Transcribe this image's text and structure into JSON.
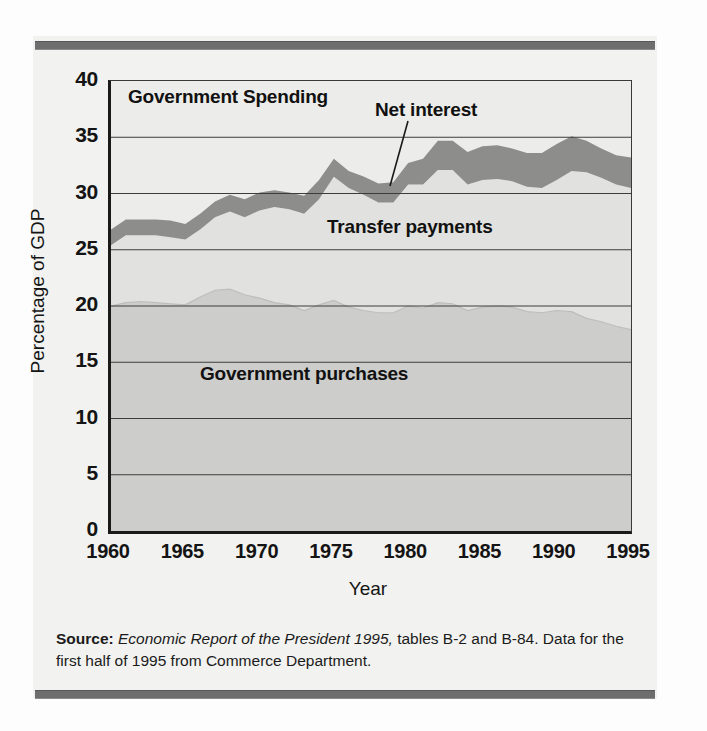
{
  "chart_data": {
    "type": "area",
    "title": "Government Spending",
    "xlabel": "Year",
    "ylabel": "Percentage of GDP",
    "xlim": [
      1960,
      1995
    ],
    "ylim": [
      0,
      40
    ],
    "ytick_labels": [
      "40",
      "35",
      "30",
      "25",
      "20",
      "15",
      "10",
      "5",
      "0"
    ],
    "ytick_values": [
      40,
      35,
      30,
      25,
      20,
      15,
      10,
      5,
      0
    ],
    "xtick_labels": [
      "1960",
      "1965",
      "1970",
      "1975",
      "1980",
      "1985",
      "1990",
      "1995"
    ],
    "xtick_values": [
      1960,
      1965,
      1970,
      1975,
      1980,
      1985,
      1990,
      1995
    ],
    "grid": true,
    "legend_position": "inline-annotations",
    "stacked": true,
    "x": [
      1960,
      1961,
      1962,
      1963,
      1964,
      1965,
      1966,
      1967,
      1968,
      1969,
      1970,
      1971,
      1972,
      1973,
      1974,
      1975,
      1976,
      1977,
      1978,
      1979,
      1980,
      1981,
      1982,
      1983,
      1984,
      1985,
      1986,
      1987,
      1988,
      1989,
      1990,
      1991,
      1992,
      1993,
      1994,
      1995
    ],
    "series": [
      {
        "name": "Government purchases",
        "color": "#cdcdcb",
        "values": [
          20.0,
          20.3,
          20.4,
          20.3,
          20.2,
          20.1,
          20.8,
          21.4,
          21.5,
          21.0,
          20.7,
          20.3,
          20.1,
          19.6,
          20.1,
          20.5,
          19.9,
          19.6,
          19.4,
          19.4,
          20.0,
          19.8,
          20.3,
          20.2,
          19.6,
          19.9,
          20.0,
          19.9,
          19.5,
          19.4,
          19.6,
          19.5,
          18.9,
          18.6,
          18.2,
          17.9
        ]
      },
      {
        "name": "Transfer payments",
        "color": "#e1e1df",
        "values": [
          5.4,
          6.0,
          5.9,
          6.0,
          5.9,
          5.8,
          6.0,
          6.5,
          6.9,
          6.9,
          7.8,
          8.5,
          8.5,
          8.6,
          9.4,
          11.0,
          10.6,
          10.3,
          9.8,
          9.8,
          10.8,
          11.0,
          11.8,
          11.9,
          11.2,
          11.3,
          11.3,
          11.2,
          11.1,
          11.1,
          11.6,
          12.5,
          13.0,
          12.8,
          12.6,
          12.6
        ]
      },
      {
        "name": "Net interest",
        "color": "#8d8d8b",
        "values": [
          1.4,
          1.4,
          1.4,
          1.4,
          1.5,
          1.4,
          1.4,
          1.4,
          1.5,
          1.6,
          1.6,
          1.5,
          1.5,
          1.6,
          1.7,
          1.6,
          1.5,
          1.6,
          1.7,
          1.8,
          1.9,
          2.3,
          2.6,
          2.6,
          2.9,
          3.0,
          3.0,
          2.9,
          3.0,
          3.1,
          3.2,
          3.1,
          2.8,
          2.6,
          2.6,
          2.7
        ]
      }
    ],
    "totals": [
      26.8,
      27.7,
      27.7,
      27.7,
      27.6,
      27.3,
      28.2,
      29.3,
      29.9,
      29.5,
      30.1,
      30.3,
      30.1,
      29.8,
      31.2,
      33.1,
      32.0,
      31.5,
      30.9,
      31.0,
      32.7,
      33.1,
      34.7,
      34.7,
      33.7,
      34.2,
      34.3,
      34.0,
      33.6,
      33.6,
      34.4,
      35.1,
      34.7,
      34.0,
      33.4,
      33.2
    ],
    "annotations": [
      {
        "name": "chart-title",
        "text": "Government Spending"
      },
      {
        "name": "net-interest-label",
        "text": "Net interest",
        "leader_line": true,
        "points_to_year": 1980
      },
      {
        "name": "transfer-payments-label",
        "text": "Transfer payments"
      },
      {
        "name": "government-purchases-label",
        "text": "Government purchases"
      }
    ]
  },
  "source": {
    "label": "Source:",
    "italic_part": "Economic Report of the President 1995,",
    "rest": " tables B-2 and B-84. Data for the first half of 1995 from Commerce Department."
  }
}
